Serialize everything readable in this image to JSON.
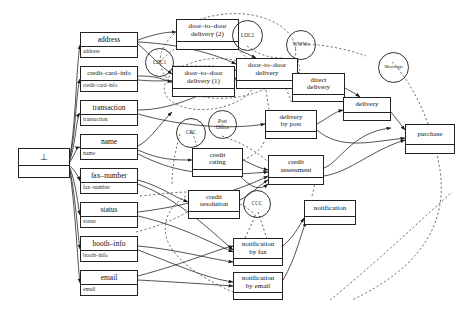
{
  "diagram": {
    "root": {
      "label": "⊥",
      "x": 18,
      "y": 148,
      "w": 52,
      "h": 30
    },
    "attributes": [
      {
        "title": "address",
        "sub": "address",
        "x": 80,
        "y": 32,
        "w": 58
      },
      {
        "title": "credit–card–info",
        "sub": "credit–card–info",
        "x": 80,
        "y": 66,
        "w": 58
      },
      {
        "title": "transaction",
        "sub": "transaction",
        "x": 80,
        "y": 100,
        "w": 58
      },
      {
        "title": "name",
        "sub": "name",
        "x": 80,
        "y": 134,
        "w": 58
      },
      {
        "title": "fax–number",
        "sub": "fax–number",
        "x": 80,
        "y": 168,
        "w": 58
      },
      {
        "title": "status",
        "sub": "status",
        "x": 80,
        "y": 202,
        "w": 58
      },
      {
        "title": "booth–info",
        "sub": "booth–info",
        "x": 80,
        "y": 236,
        "w": 58
      },
      {
        "title": "email",
        "sub": "email",
        "x": 80,
        "y": 270,
        "w": 58
      }
    ],
    "processes": [
      {
        "id": "dtd2",
        "label": "door-to-door delivery (2)",
        "lines": [
          "door–to–door",
          "delivery (2)"
        ],
        "x": 176,
        "y": 19,
        "w": 63,
        "h": 31
      },
      {
        "id": "dtd1",
        "label": "door-to-door delivery (1)",
        "lines": [
          "door–to–door",
          "delivery (1)"
        ],
        "x": 172,
        "y": 66,
        "w": 63,
        "h": 31
      },
      {
        "id": "dtd",
        "label": "door-to-door delivery",
        "lines": [
          "door–to–door",
          "delivery"
        ],
        "x": 236,
        "y": 58,
        "w": 62,
        "h": 31
      },
      {
        "id": "direct",
        "label": "direct delivery",
        "lines": [
          "direct",
          "delivery"
        ],
        "x": 292,
        "y": 73,
        "w": 53,
        "h": 29
      },
      {
        "id": "delivery",
        "label": "delivery",
        "lines": [
          "delivery"
        ],
        "x": 343,
        "y": 97,
        "w": 48,
        "h": 24
      },
      {
        "id": "post",
        "label": "delivery by post",
        "lines": [
          "delivery",
          "by post"
        ],
        "x": 265,
        "y": 110,
        "w": 52,
        "h": 29
      },
      {
        "id": "purchase",
        "label": "purchase",
        "lines": [
          "purchase"
        ],
        "x": 405,
        "y": 124,
        "w": 50,
        "h": 30
      },
      {
        "id": "crating",
        "label": "credit rating",
        "lines": [
          "credit",
          "rating"
        ],
        "x": 192,
        "y": 148,
        "w": 51,
        "h": 29
      },
      {
        "id": "cassess",
        "label": "credit assessment",
        "lines": [
          "credit",
          "assessment"
        ],
        "x": 268,
        "y": 155,
        "w": 56,
        "h": 30
      },
      {
        "id": "cresol",
        "label": "credit resolution",
        "lines": [
          "credit",
          "resolution"
        ],
        "x": 188,
        "y": 190,
        "w": 52,
        "h": 29
      },
      {
        "id": "notif",
        "label": "notification",
        "lines": [
          "notification"
        ],
        "x": 304,
        "y": 200,
        "w": 52,
        "h": 25
      },
      {
        "id": "nfax",
        "label": "notification by fax",
        "lines": [
          "notification",
          "by fax"
        ],
        "x": 233,
        "y": 238,
        "w": 50,
        "h": 28
      },
      {
        "id": "nemail",
        "label": "notification by email",
        "lines": [
          "notification",
          "by email"
        ],
        "x": 233,
        "y": 272,
        "w": 50,
        "h": 28
      }
    ],
    "agents": [
      {
        "id": "ldc1",
        "label": "LDC1",
        "lines": [
          "LDC1"
        ],
        "x": 145,
        "y": 48,
        "d": 29
      },
      {
        "id": "ldc2",
        "label": "LDC2",
        "lines": [
          "LDC2"
        ],
        "x": 232,
        "y": 20,
        "d": 31
      },
      {
        "id": "wwws",
        "label": "WWWs",
        "lines": [
          "WWWs"
        ],
        "x": 286,
        "y": 30,
        "d": 30
      },
      {
        "id": "miss",
        "label": "Mississippi",
        "lines": [
          "Mississippi"
        ],
        "x": 378,
        "y": 52,
        "d": 31
      },
      {
        "id": "crc",
        "label": "CRC",
        "lines": [
          "CRC"
        ],
        "x": 176,
        "y": 118,
        "d": 30
      },
      {
        "id": "pof",
        "label": "Post Office",
        "lines": [
          "Post",
          "Office"
        ],
        "x": 208,
        "y": 110,
        "d": 29
      },
      {
        "id": "ccc",
        "label": "CCC",
        "lines": [
          "CCC"
        ],
        "x": 243,
        "y": 190,
        "d": 28
      }
    ]
  }
}
